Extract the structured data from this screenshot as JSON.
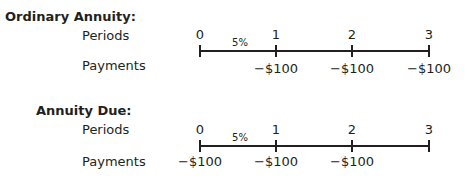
{
  "ordinary": {
    "title": "Ordinary Annuity:",
    "periods_label": "Periods",
    "payments_label": "Payments",
    "rate": "5%",
    "periods": [
      "0",
      "1",
      "2",
      "3"
    ],
    "payments": [
      "",
      "−$100",
      "−$100",
      "−$100"
    ]
  },
  "due": {
    "title": "Annuity Due:",
    "periods_label": "Periods",
    "payments_label": "Payments",
    "rate": "5%",
    "periods": [
      "0",
      "1",
      "2",
      "3"
    ],
    "payments": [
      "−$100",
      "−$100",
      "−$100",
      ""
    ]
  }
}
